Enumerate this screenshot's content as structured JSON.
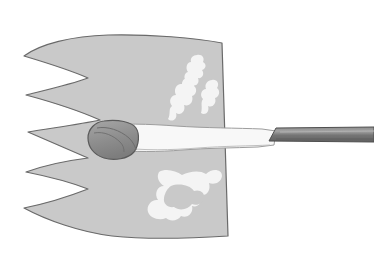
{
  "figure": {
    "background_color": "#ffffff",
    "canvas": {
      "width": 374,
      "height": 271
    },
    "palette": {
      "body_fill": "#c9c9c9",
      "body_outline": "#6a6a6a",
      "lesion_fill": "#f2f2f2",
      "tract_fill": "#f7f7f7",
      "tract_outline": "#9a9a9a",
      "nodule_fill": "#8e8e8e",
      "nodule_outline": "#5a5a5a",
      "rod_fill": "#7b7b7b",
      "rod_outline": "#4f4f4f",
      "rod_highlight": "#a0a0a0"
    },
    "parts": {
      "body": {
        "label": "serrated-body",
        "description": "Large gray slab with five tapering prongs along the left edge and a straight slanted right edge",
        "prong_count": 5,
        "prong_tips": [
          {
            "x": 24,
            "y": 56
          },
          {
            "x": 26,
            "y": 95
          },
          {
            "x": 28,
            "y": 132
          },
          {
            "x": 26,
            "y": 172
          },
          {
            "x": 24,
            "y": 208
          }
        ],
        "notches": [
          {
            "x": 88,
            "y": 78
          },
          {
            "x": 100,
            "y": 120
          },
          {
            "x": 88,
            "y": 158
          },
          {
            "x": 88,
            "y": 189
          }
        ],
        "right_edge": {
          "top": {
            "x": 222,
            "y": 43
          },
          "bottom": {
            "x": 228,
            "y": 236
          }
        }
      },
      "lesion_upper": {
        "label": "upper-lesion-cluster",
        "description": "Three irregular pale blobs in the upper right quadrant of the body",
        "blob_count": 3
      },
      "lesion_lower": {
        "label": "lower-lesion-cluster",
        "description": "One large connected irregular pale shape in the lower right quadrant of the body",
        "blob_count": 1
      },
      "tract": {
        "label": "pale-tract-band",
        "description": "Horizontal pale band crossing the body from the nodule to the rod",
        "start_x": 92,
        "end_x": 275,
        "center_y": 138
      },
      "nodule": {
        "label": "dark-nodule",
        "description": "Dark gray rounded mass at the left end of the tract",
        "center": {
          "x": 112,
          "y": 139
        },
        "radius_x": 24,
        "radius_y": 18
      },
      "rod": {
        "label": "probe-rod",
        "description": "Dark gray straight tapered rod extending from the tract to the right image edge",
        "start_x": 269,
        "end_x": 374,
        "top_y": 128,
        "bottom_y": 141
      }
    }
  }
}
